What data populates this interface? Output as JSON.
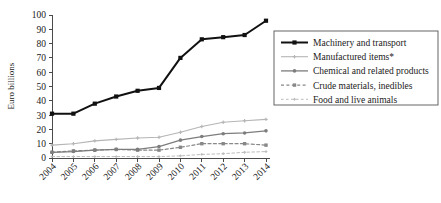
{
  "chart_data": {
    "type": "line",
    "title": "",
    "xlabel": "",
    "ylabel": "Euro billions",
    "ylim": [
      0,
      100
    ],
    "ytick_step": 10,
    "yticks": [
      "0",
      "10",
      "20",
      "30",
      "40",
      "50",
      "60",
      "70",
      "80",
      "90",
      "100"
    ],
    "grid": false,
    "legend_position": "right",
    "categories": [
      "2004",
      "2005",
      "2006",
      "2007",
      "2008",
      "2009",
      "2010",
      "2011",
      "2012",
      "2013",
      "2014"
    ],
    "series": [
      {
        "name": "Machinery and transport",
        "values": [
          31,
          31,
          38,
          43,
          47,
          49,
          70,
          83,
          84.5,
          86,
          96
        ],
        "color": "#111111",
        "line_width": 2.0,
        "dash": "none",
        "marker": "square",
        "marker_size": 4.2
      },
      {
        "name": "Manufactured items*",
        "values": [
          9,
          10,
          12,
          13,
          14,
          14.5,
          18,
          22,
          25,
          26,
          27
        ],
        "color": "#b5b5b5",
        "line_width": 1.1,
        "dash": "none",
        "marker": "plus",
        "marker_size": 3.4
      },
      {
        "name": "Chemical and related products",
        "values": [
          4,
          4.5,
          5.5,
          6,
          6,
          8,
          12.5,
          15,
          17,
          17.5,
          19
        ],
        "color": "#7d7d7d",
        "line_width": 1.3,
        "dash": "none",
        "marker": "circle",
        "marker_size": 3.0
      },
      {
        "name": "Crude materials, inedibles",
        "values": [
          4,
          5,
          5.5,
          6,
          5.5,
          5.5,
          7.5,
          10,
          10,
          10,
          9
        ],
        "color": "#888888",
        "line_width": 1.2,
        "dash": "3,2.4",
        "marker": "square",
        "marker_size": 3.4
      },
      {
        "name": "Food and live animals",
        "values": [
          1,
          1,
          1,
          1,
          1,
          1,
          1.5,
          2.5,
          3,
          4,
          4.5
        ],
        "color": "#bcbcbc",
        "line_width": 1.0,
        "dash": "2.6,2.4",
        "marker": "plus",
        "marker_size": 2.8
      }
    ]
  },
  "legend": {
    "entries": [
      "Machinery and transport",
      "Manufactured items*",
      "Chemical and related products",
      "Crude materials, inedibles",
      "Food and live animals"
    ]
  }
}
